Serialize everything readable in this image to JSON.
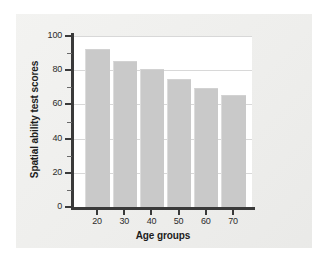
{
  "chart_data": {
    "type": "bar",
    "title": "",
    "xlabel": "Age groups",
    "ylabel": "Spatial ability test scores",
    "categories": [
      "20",
      "30",
      "40",
      "50",
      "60",
      "70"
    ],
    "values": [
      92,
      85,
      80,
      74,
      69,
      65
    ],
    "ylim": [
      0,
      100
    ],
    "ytick_labels": [
      "0",
      "20",
      "40",
      "60",
      "80",
      "100"
    ],
    "ytick_values": [
      0,
      20,
      40,
      60,
      80,
      100
    ],
    "yminor_values": [
      10,
      30,
      50,
      70,
      90
    ],
    "grid": true,
    "legend": "none",
    "bar_color": "#c9c9c9",
    "axis_color": "#3a3a3a",
    "grid_color": "#d8d8d8",
    "plot_background": "#ffffff",
    "panel_background": "#f0f0ee"
  }
}
